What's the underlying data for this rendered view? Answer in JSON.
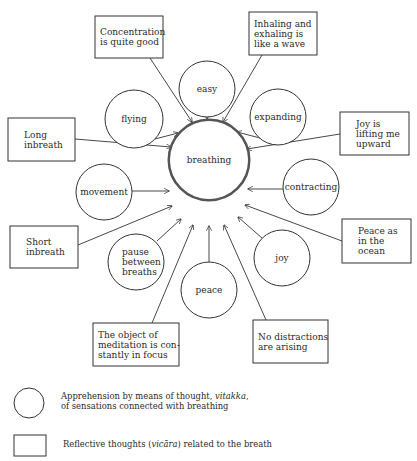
{
  "diagram": {
    "center": {
      "label": "breathing",
      "cx": 209,
      "cy": 160,
      "r": 40
    },
    "circles": [
      {
        "id": "easy",
        "lines": [
          "easy"
        ],
        "cx": 207,
        "cy": 89,
        "r": 28
      },
      {
        "id": "flying",
        "lines": [
          "flying"
        ],
        "cx": 134,
        "cy": 119,
        "r": 29
      },
      {
        "id": "expanding",
        "lines": [
          "expanding"
        ],
        "cx": 278,
        "cy": 117,
        "r": 28
      },
      {
        "id": "movement",
        "lines": [
          "movement"
        ],
        "cx": 104,
        "cy": 192,
        "r": 28
      },
      {
        "id": "contracting",
        "lines": [
          "contracting"
        ],
        "cx": 311,
        "cy": 187,
        "r": 28
      },
      {
        "id": "pause",
        "lines": [
          "pause",
          "between",
          "breaths"
        ],
        "cx": 136,
        "cy": 262,
        "r": 28
      },
      {
        "id": "peace",
        "lines": [
          "peace"
        ],
        "cx": 209,
        "cy": 290,
        "r": 28
      },
      {
        "id": "joy",
        "lines": [
          "joy"
        ],
        "cx": 282,
        "cy": 258,
        "r": 28
      }
    ],
    "boxes": [
      {
        "id": "concentration",
        "lines": [
          "Concentration",
          "is quite good"
        ],
        "x": 95,
        "y": 16,
        "w": 68,
        "h": 42
      },
      {
        "id": "wave",
        "lines": [
          "Inhaling and",
          "exhaling is",
          "like a wave"
        ],
        "x": 249,
        "y": 12,
        "w": 68,
        "h": 43
      },
      {
        "id": "long",
        "lines": [
          "Long",
          "inbreath"
        ],
        "x": 8,
        "y": 118,
        "w": 67,
        "h": 43
      },
      {
        "id": "joy-lifting",
        "lines": [
          "Joy is",
          "lifting me",
          "upward"
        ],
        "x": 340,
        "y": 112,
        "w": 69,
        "h": 43
      },
      {
        "id": "short",
        "lines": [
          "Short",
          "inbreath"
        ],
        "x": 10,
        "y": 226,
        "w": 68,
        "h": 42
      },
      {
        "id": "peace-ocean",
        "lines": [
          "Peace as",
          "in the",
          "ocean"
        ],
        "x": 342,
        "y": 219,
        "w": 69,
        "h": 44
      },
      {
        "id": "object",
        "lines": [
          "The object of",
          "meditation is con-",
          "stantly in focus"
        ],
        "x": 93,
        "y": 323,
        "w": 86,
        "h": 43
      },
      {
        "id": "distractions",
        "lines": [
          "No distractions",
          "are arising"
        ],
        "x": 253,
        "y": 320,
        "w": 75,
        "h": 43
      }
    ],
    "edges": [
      {
        "from": "easy",
        "x1": 207,
        "y1": 117,
        "x2": 207,
        "y2": 119
      },
      {
        "from": "concentration",
        "x1": 150,
        "y1": 58,
        "x2": 192,
        "y2": 122
      },
      {
        "from": "wave",
        "x1": 262,
        "y1": 55,
        "x2": 223,
        "y2": 122
      },
      {
        "from": "flying",
        "x1": 155,
        "y1": 139,
        "x2": 178,
        "y2": 133
      },
      {
        "from": "expanding",
        "x1": 260,
        "y1": 138,
        "x2": 237,
        "y2": 132
      },
      {
        "from": "long",
        "x1": 75,
        "y1": 139,
        "x2": 171,
        "y2": 147
      },
      {
        "from": "joy-lifting",
        "x1": 340,
        "y1": 134,
        "x2": 247,
        "y2": 149
      },
      {
        "from": "movement",
        "x1": 132,
        "y1": 191,
        "x2": 169,
        "y2": 191
      },
      {
        "from": "contracting",
        "x1": 283,
        "y1": 189,
        "x2": 248,
        "y2": 189
      },
      {
        "from": "short",
        "x1": 78,
        "y1": 245,
        "x2": 172,
        "y2": 206
      },
      {
        "from": "peace-ocean",
        "x1": 342,
        "y1": 241,
        "x2": 245,
        "y2": 205
      },
      {
        "from": "pause",
        "x1": 157,
        "y1": 241,
        "x2": 181,
        "y2": 219
      },
      {
        "from": "joy",
        "x1": 262,
        "y1": 238,
        "x2": 238,
        "y2": 217
      },
      {
        "from": "peace",
        "x1": 209,
        "y1": 262,
        "x2": 209,
        "y2": 226
      },
      {
        "from": "object",
        "x1": 152,
        "y1": 323,
        "x2": 193,
        "y2": 225
      },
      {
        "from": "distractions",
        "x1": 266,
        "y1": 320,
        "x2": 224,
        "y2": 225
      }
    ]
  },
  "legend": {
    "circle": {
      "text_line1_prefix": "Apprehension by means of thought, ",
      "text_line1_italic": "vitakka",
      "text_line1_suffix": ",",
      "text_line2": "of sensations connected with breathing"
    },
    "box": {
      "text_prefix": "Reflective thoughts (",
      "text_italic": "vicāra",
      "text_suffix": ") related to the breath"
    }
  }
}
